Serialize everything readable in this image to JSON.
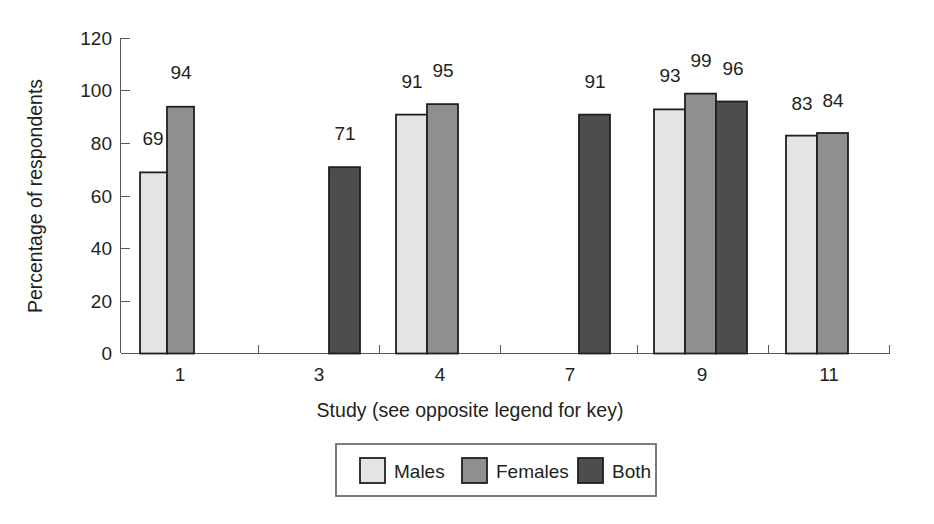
{
  "chart_data": {
    "type": "bar",
    "title": "",
    "xlabel": "Study (see opposite legend for key)",
    "ylabel": "Percentage of respondents",
    "categories": [
      "1",
      "3",
      "4",
      "7",
      "9",
      "11"
    ],
    "ylim": [
      0,
      120
    ],
    "yticks": [
      0,
      20,
      40,
      60,
      80,
      100,
      120
    ],
    "ytick_labels": [
      "0",
      "20",
      "40",
      "60",
      "80",
      "100",
      "120"
    ],
    "grid": false,
    "legend_position": "bottom",
    "series": [
      {
        "name": "Males",
        "color": "#e4e4e2",
        "values": [
          69,
          null,
          91,
          null,
          93,
          83
        ]
      },
      {
        "name": "Females",
        "color": "#8f8f8f",
        "values": [
          94,
          null,
          95,
          null,
          99,
          84
        ]
      },
      {
        "name": "Both",
        "color": "#4d4d4d",
        "values": [
          null,
          71,
          null,
          91,
          96,
          null
        ]
      }
    ],
    "data_labels": [
      {
        "group": "1",
        "series": "Males",
        "value": "69"
      },
      {
        "group": "1",
        "series": "Females",
        "value": "94"
      },
      {
        "group": "3",
        "series": "Both",
        "value": "71"
      },
      {
        "group": "4",
        "series": "Males",
        "value": "91"
      },
      {
        "group": "4",
        "series": "Females",
        "value": "95"
      },
      {
        "group": "7",
        "series": "Both",
        "value": "91"
      },
      {
        "group": "9",
        "series": "Males",
        "value": "93"
      },
      {
        "group": "9",
        "series": "Females",
        "value": "99"
      },
      {
        "group": "9",
        "series": "Both",
        "value": "96"
      },
      {
        "group": "11",
        "series": "Males",
        "value": "83"
      },
      {
        "group": "11",
        "series": "Females",
        "value": "84"
      }
    ]
  },
  "axes": {
    "y_title": "Percentage of respondents",
    "x_title": "Study (see opposite legend for key)",
    "y_ticks": [
      "120",
      "100",
      "80",
      "60",
      "40",
      "20",
      "0"
    ],
    "x_ticks": [
      "1",
      "3",
      "4",
      "7",
      "9",
      "11"
    ]
  },
  "legend": {
    "items": [
      {
        "label": "Males",
        "color": "#e4e4e2"
      },
      {
        "label": "Females",
        "color": "#8f8f8f"
      },
      {
        "label": "Both",
        "color": "#4d4d4d"
      }
    ]
  },
  "bars": [
    {
      "id": "g1-males",
      "label": "69",
      "x": 140,
      "w": 27,
      "value": 69,
      "color": "#e4e4e2",
      "label_x": 153,
      "label_y": 145
    },
    {
      "id": "g1-females",
      "label": "94",
      "x": 167,
      "w": 27,
      "value": 94,
      "color": "#8f8f8f",
      "label_x": 181,
      "label_y": 79
    },
    {
      "id": "g3-both",
      "label": "71",
      "x": 329,
      "w": 31,
      "value": 71,
      "color": "#4d4d4d",
      "label_x": 345,
      "label_y": 140
    },
    {
      "id": "g4-males",
      "label": "91",
      "x": 396,
      "w": 31,
      "value": 91,
      "color": "#e4e4e2",
      "label_x": 412,
      "label_y": 88
    },
    {
      "id": "g4-females",
      "label": "95",
      "x": 427,
      "w": 31,
      "value": 95,
      "color": "#8f8f8f",
      "label_x": 443,
      "label_y": 77
    },
    {
      "id": "g7-both",
      "label": "91",
      "x": 579,
      "w": 31,
      "value": 91,
      "color": "#4d4d4d",
      "label_x": 595,
      "label_y": 88
    },
    {
      "id": "g9-males",
      "label": "93",
      "x": 654,
      "w": 31,
      "value": 93,
      "color": "#e4e4e2",
      "label_x": 670,
      "label_y": 82
    },
    {
      "id": "g9-females",
      "label": "99",
      "x": 685,
      "w": 31,
      "value": 99,
      "color": "#8f8f8f",
      "label_x": 701,
      "label_y": 67
    },
    {
      "id": "g9-both",
      "label": "96",
      "x": 716,
      "w": 31,
      "value": 96,
      "color": "#4d4d4d",
      "label_x": 733,
      "label_y": 75
    },
    {
      "id": "g11-males",
      "label": "83",
      "x": 786,
      "w": 31,
      "value": 83,
      "color": "#e4e4e2",
      "label_x": 802,
      "label_y": 110
    },
    {
      "id": "g11-females",
      "label": "84",
      "x": 817,
      "w": 31,
      "value": 84,
      "color": "#8f8f8f",
      "label_x": 833,
      "label_y": 107
    }
  ]
}
